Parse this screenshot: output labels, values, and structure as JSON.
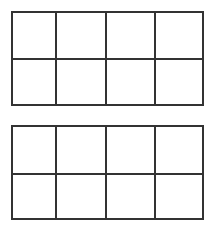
{
  "diagram": {
    "type": "grid-pair",
    "line_color": "#333333",
    "background": "#ffffff",
    "grids": [
      {
        "id": "top",
        "rows": 2,
        "cols": 4,
        "top": 11,
        "vlines": [
          43,
          93,
          142
        ],
        "hline": 46
      },
      {
        "id": "bottom",
        "rows": 2,
        "cols": 4,
        "top": 125,
        "vlines": [
          43,
          93,
          142
        ],
        "hline": 47
      }
    ]
  }
}
